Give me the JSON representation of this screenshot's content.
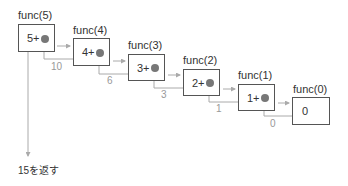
{
  "diagram": {
    "calls": [
      {
        "label": "func(5)",
        "expr": "5+",
        "return_value": "10"
      },
      {
        "label": "func(4)",
        "expr": "4+",
        "return_value": "6"
      },
      {
        "label": "func(3)",
        "expr": "3+",
        "return_value": "3"
      },
      {
        "label": "func(2)",
        "expr": "2+",
        "return_value": "1"
      },
      {
        "label": "func(1)",
        "expr": "1+",
        "return_value": "0"
      },
      {
        "label": "func(0)",
        "expr": "0"
      }
    ],
    "final_result": "15を返す",
    "colors": {
      "box_border": "#555555",
      "dot": "#777777",
      "arrow": "#aaaaaa",
      "return_text": "#999999"
    }
  }
}
